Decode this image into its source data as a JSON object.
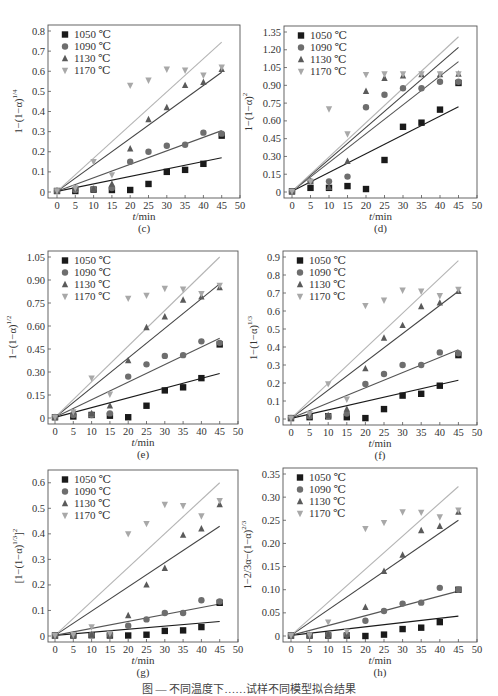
{
  "colors": {
    "1050": "#1a1a1a",
    "1090": "#6e6e6e",
    "1130": "#5a5a5a",
    "1170": "#a8a8a8",
    "fit_1050": "#1a1a1a",
    "fit_1090": "#555555",
    "fit_1130": "#444444",
    "fit_1170": "#b4b4b4",
    "axis": "#555555"
  },
  "legend": [
    "1050 ℃",
    "1090 ℃",
    "1130 ℃",
    "1170 ℃"
  ],
  "caption": "图 — 不同温度下……试样不同模型拟合结果",
  "chart_data": [
    {
      "id": "c",
      "type": "scatter",
      "panel_label": "(c)",
      "title": "",
      "xlabel": "t/min",
      "ylabel": "1−(1−α)^{1/4}",
      "ylabel_main": "1−(1−α)",
      "ylabel_sup": "1/4",
      "xlim": [
        0,
        50
      ],
      "ylim": [
        0,
        0.8
      ],
      "xticks": [
        0,
        5,
        10,
        15,
        20,
        25,
        30,
        35,
        40,
        45,
        50
      ],
      "yticks": [
        0,
        0.1,
        0.2,
        0.3,
        0.4,
        0.5,
        0.6,
        0.7,
        0.8
      ],
      "ytick_labels": [
        "0",
        "0.1",
        "0.2",
        "0.3",
        "0.4",
        "0.5",
        "0.6",
        "0.7",
        "0.8"
      ],
      "grid": false,
      "legend_position": "upper left",
      "box": {
        "x": 48,
        "y": 25,
        "w": 192,
        "h": 173,
        "x0": 57
      },
      "x": [
        0,
        5,
        10,
        15,
        20,
        25,
        30,
        35,
        40,
        45
      ],
      "series": [
        {
          "name": "1050 ℃",
          "marker": "square",
          "values": [
            0.005,
            0.005,
            0.012,
            0.01,
            0.01,
            0.04,
            0.1,
            0.11,
            0.14,
            0.28
          ],
          "fit_end": 0.17
        },
        {
          "name": "1090 ℃",
          "marker": "circle",
          "values": [
            0.005,
            0.01,
            0.015,
            0.02,
            0.15,
            0.2,
            0.23,
            0.235,
            0.295,
            0.29
          ],
          "fit_end": 0.305
        },
        {
          "name": "1130 ℃",
          "marker": "triangle-up",
          "values": [
            0.005,
            0.02,
            0.015,
            0.04,
            0.215,
            0.36,
            0.42,
            0.53,
            0.545,
            0.61
          ],
          "fit_end": 0.595
        },
        {
          "name": "1170 ℃",
          "marker": "triangle-down",
          "values": [
            0.005,
            0.02,
            0.15,
            0.085,
            0.53,
            0.555,
            0.61,
            0.605,
            0.58,
            0.62
          ],
          "fit_end": 0.745
        }
      ]
    },
    {
      "id": "d",
      "type": "scatter",
      "panel_label": "(d)",
      "title": "",
      "xlabel": "t/min",
      "ylabel": "1−(1−α)^2",
      "ylabel_main": "1−(1−α)",
      "ylabel_sup": "2",
      "xlim": [
        0,
        50
      ],
      "ylim": [
        0,
        1.35
      ],
      "xticks": [
        0,
        5,
        10,
        15,
        20,
        25,
        30,
        35,
        40,
        45,
        50
      ],
      "yticks": [
        0,
        0.15,
        0.3,
        0.45,
        0.6,
        0.75,
        0.9,
        1.05,
        1.2,
        1.35
      ],
      "ytick_labels": [
        "0",
        "0.15",
        "0.30",
        "0.45",
        "0.60",
        "0.75",
        "0.90",
        "1.05",
        "1.20",
        "1.35"
      ],
      "grid": false,
      "legend_position": "upper left",
      "box": {
        "x": 284,
        "y": 26,
        "w": 193,
        "h": 172,
        "x0": 292
      },
      "x": [
        0,
        5,
        10,
        15,
        20,
        25,
        30,
        35,
        40,
        45
      ],
      "series": [
        {
          "name": "1050 ℃",
          "marker": "square",
          "values": [
            0.005,
            0.035,
            0.035,
            0.05,
            0.025,
            0.27,
            0.55,
            0.585,
            0.695,
            0.92
          ],
          "fit_end": 0.72
        },
        {
          "name": "1090 ℃",
          "marker": "circle",
          "values": [
            0.005,
            0.09,
            0.09,
            0.13,
            0.715,
            0.82,
            0.875,
            0.875,
            0.93,
            0.93
          ],
          "fit_end": 1.1
        },
        {
          "name": "1130 ℃",
          "marker": "triangle-up",
          "values": [
            0.005,
            0.09,
            0.04,
            0.26,
            0.85,
            0.96,
            0.98,
            0.99,
            0.99,
            0.995
          ],
          "fit_end": 1.22
        },
        {
          "name": "1170 ℃",
          "marker": "triangle-down",
          "values": [
            0.005,
            0.09,
            0.7,
            0.49,
            0.99,
            0.995,
            0.995,
            0.995,
            0.995,
            0.995
          ],
          "fit_end": 1.31
        }
      ]
    },
    {
      "id": "e",
      "type": "scatter",
      "panel_label": "(e)",
      "title": "",
      "xlabel": "t/min",
      "ylabel": "1−(1−α)^{1/2}",
      "ylabel_main": "1−(1−α)",
      "ylabel_sup": "1/2",
      "xlim": [
        0,
        50
      ],
      "ylim": [
        0,
        1.05
      ],
      "xticks": [
        0,
        5,
        10,
        15,
        20,
        25,
        30,
        35,
        40,
        45,
        50
      ],
      "yticks": [
        0,
        0.15,
        0.3,
        0.45,
        0.6,
        0.75,
        0.9,
        1.05
      ],
      "ytick_labels": [
        "0",
        "0.15",
        "0.30",
        "0.45",
        "0.60",
        "0.75",
        "0.90",
        "1.05"
      ],
      "grid": false,
      "legend_position": "upper left",
      "box": {
        "x": 48,
        "y": 251,
        "w": 190,
        "h": 173,
        "x0": 55
      },
      "x": [
        0,
        5,
        10,
        15,
        20,
        25,
        30,
        35,
        40,
        45
      ],
      "series": [
        {
          "name": "1050 ℃",
          "marker": "square",
          "values": [
            0.005,
            0.01,
            0.02,
            0.015,
            0.005,
            0.08,
            0.18,
            0.2,
            0.26,
            0.48
          ],
          "fit_end": 0.29
        },
        {
          "name": "1090 ℃",
          "marker": "circle",
          "values": [
            0.005,
            0.02,
            0.02,
            0.03,
            0.27,
            0.35,
            0.405,
            0.41,
            0.5,
            0.49
          ],
          "fit_end": 0.52
        },
        {
          "name": "1130 ℃",
          "marker": "triangle-up",
          "values": [
            0.005,
            0.04,
            0.03,
            0.08,
            0.375,
            0.59,
            0.66,
            0.77,
            0.79,
            0.85
          ],
          "fit_end": 0.875
        },
        {
          "name": "1170 ℃",
          "marker": "triangle-down",
          "values": [
            0.005,
            0.04,
            0.26,
            0.155,
            0.78,
            0.8,
            0.845,
            0.84,
            0.81,
            0.865
          ],
          "fit_end": 1.05
        }
      ]
    },
    {
      "id": "f",
      "type": "scatter",
      "panel_label": "(f)",
      "title": "",
      "xlabel": "t/min",
      "ylabel": "1−(1−α)^{1/3}",
      "ylabel_main": "1−(1−α)",
      "ylabel_sup": "1/3",
      "xlim": [
        0,
        50
      ],
      "ylim": [
        0,
        0.9
      ],
      "xticks": [
        0,
        5,
        10,
        15,
        20,
        25,
        30,
        35,
        40,
        45,
        50
      ],
      "yticks": [
        0,
        0.1,
        0.2,
        0.3,
        0.4,
        0.5,
        0.6,
        0.7,
        0.8,
        0.9
      ],
      "ytick_labels": [
        "0",
        "0.1",
        "0.2",
        "0.3",
        "0.4",
        "0.5",
        "0.6",
        "0.7",
        "0.8",
        "0.9"
      ],
      "grid": false,
      "legend_position": "upper left",
      "box": {
        "x": 283,
        "y": 251,
        "w": 194,
        "h": 174,
        "x0": 291
      },
      "x": [
        0,
        5,
        10,
        15,
        20,
        25,
        30,
        35,
        40,
        45
      ],
      "series": [
        {
          "name": "1050 ℃",
          "marker": "square",
          "values": [
            0.005,
            0.01,
            0.015,
            0.01,
            0.005,
            0.055,
            0.13,
            0.14,
            0.185,
            0.355
          ],
          "fit_end": 0.215
        },
        {
          "name": "1090 ℃",
          "marker": "circle",
          "values": [
            0.005,
            0.015,
            0.015,
            0.03,
            0.195,
            0.25,
            0.3,
            0.3,
            0.37,
            0.365
          ],
          "fit_end": 0.385
        },
        {
          "name": "1130 ℃",
          "marker": "triangle-up",
          "values": [
            0.005,
            0.03,
            0.02,
            0.055,
            0.28,
            0.45,
            0.52,
            0.625,
            0.645,
            0.71
          ],
          "fit_end": 0.71
        },
        {
          "name": "1170 ℃",
          "marker": "triangle-down",
          "values": [
            0.005,
            0.03,
            0.195,
            0.11,
            0.63,
            0.66,
            0.715,
            0.71,
            0.685,
            0.72
          ],
          "fit_end": 0.88
        }
      ]
    },
    {
      "id": "g",
      "type": "scatter",
      "panel_label": "(g)",
      "title": "",
      "xlabel": "t/min",
      "ylabel": "[1−(1−α)^{1/3}]^2",
      "ylabel_main": "[1−(1−α)",
      "ylabel_sup": "1/3",
      "ylabel_tail": "]",
      "ylabel_sup2": "2",
      "xlim": [
        0,
        50
      ],
      "ylim": [
        0,
        0.65
      ],
      "xticks": [
        0,
        5,
        10,
        15,
        20,
        25,
        30,
        35,
        40,
        45,
        50
      ],
      "yticks": [
        0,
        0.1,
        0.2,
        0.3,
        0.4,
        0.5,
        0.6
      ],
      "ytick_labels": [
        "0",
        "0.1",
        "0.2",
        "0.3",
        "0.4",
        "0.5",
        "0.6"
      ],
      "grid": false,
      "legend_position": "upper left",
      "box": {
        "x": 48,
        "y": 470,
        "w": 190,
        "h": 172,
        "x0": 55
      },
      "x": [
        0,
        5,
        10,
        15,
        20,
        25,
        30,
        35,
        40,
        45
      ],
      "series": [
        {
          "name": "1050 ℃",
          "marker": "square",
          "values": [
            0.002,
            0.002,
            0.003,
            0.002,
            0.002,
            0.005,
            0.02,
            0.022,
            0.035,
            0.13
          ],
          "fit_end": 0.057
        },
        {
          "name": "1090 ℃",
          "marker": "circle",
          "values": [
            0.002,
            0.003,
            0.004,
            0.005,
            0.04,
            0.065,
            0.09,
            0.09,
            0.14,
            0.135
          ],
          "fit_end": 0.125
        },
        {
          "name": "1130 ℃",
          "marker": "triangle-up",
          "values": [
            0.002,
            0.005,
            0.005,
            0.005,
            0.08,
            0.2,
            0.265,
            0.395,
            0.42,
            0.515
          ],
          "fit_end": 0.43
        },
        {
          "name": "1170 ℃",
          "marker": "triangle-down",
          "values": [
            0.002,
            0.005,
            0.035,
            0.01,
            0.4,
            0.44,
            0.515,
            0.51,
            0.47,
            0.53
          ],
          "fit_end": 0.6
        }
      ]
    },
    {
      "id": "h",
      "type": "scatter",
      "panel_label": "(h)",
      "title": "",
      "xlabel": "t/min",
      "ylabel": "1−2/3α−(1−α)^{2/3}",
      "ylabel_main": "1−2/3α−(1−α)",
      "ylabel_sup": "2/3",
      "xlim": [
        0,
        50
      ],
      "ylim": [
        0,
        0.35
      ],
      "xticks": [
        0,
        5,
        10,
        15,
        20,
        25,
        30,
        35,
        40,
        45,
        50
      ],
      "yticks": [
        0,
        0.05,
        0.1,
        0.15,
        0.2,
        0.25,
        0.3,
        0.35
      ],
      "ytick_labels": [
        "0",
        "0.05",
        "0.10",
        "0.15",
        "0.20",
        "0.25",
        "0.30",
        "0.35"
      ],
      "grid": false,
      "legend_position": "upper left",
      "box": {
        "x": 283,
        "y": 468,
        "w": 194,
        "h": 174,
        "x0": 291
      },
      "x": [
        0,
        5,
        10,
        15,
        20,
        25,
        30,
        35,
        40,
        45
      ],
      "series": [
        {
          "name": "1050 ℃",
          "marker": "square",
          "values": [
            0.001,
            0.001,
            0.001,
            0.001,
            0.0,
            0.003,
            0.015,
            0.018,
            0.03,
            0.1
          ],
          "fit_end": 0.043
        },
        {
          "name": "1090 ℃",
          "marker": "circle",
          "values": [
            0.001,
            0.001,
            0.002,
            0.003,
            0.033,
            0.054,
            0.07,
            0.072,
            0.104,
            0.1
          ],
          "fit_end": 0.097
        },
        {
          "name": "1130 ℃",
          "marker": "triangle-up",
          "values": [
            0.001,
            0.002,
            0.003,
            0.003,
            0.062,
            0.14,
            0.175,
            0.228,
            0.237,
            0.268
          ],
          "fit_end": 0.25
        },
        {
          "name": "1170 ℃",
          "marker": "triangle-down",
          "values": [
            0.001,
            0.002,
            0.03,
            0.01,
            0.232,
            0.245,
            0.268,
            0.267,
            0.257,
            0.272
          ],
          "fit_end": 0.323
        }
      ]
    }
  ]
}
